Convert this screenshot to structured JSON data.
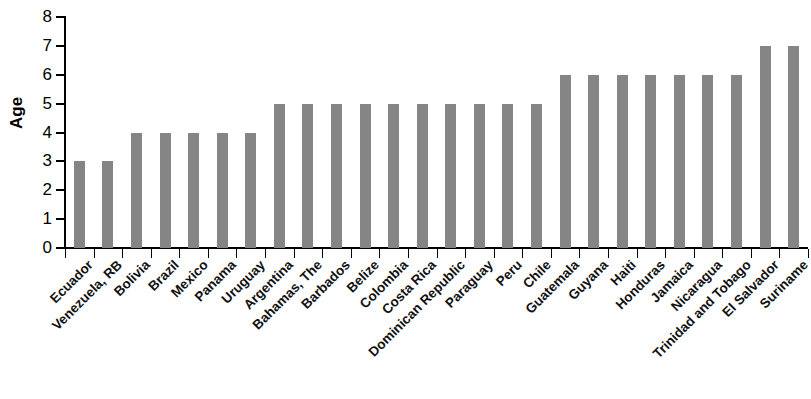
{
  "chart_data": {
    "type": "bar",
    "title": "",
    "subtitle": "",
    "xlabel": "",
    "ylabel": "Age",
    "ylim": [
      0,
      8
    ],
    "yticks": [
      0,
      1,
      2,
      3,
      4,
      5,
      6,
      7,
      8
    ],
    "grid": false,
    "legend": null,
    "bar_color": "#858585",
    "axis_color": "#000000",
    "categories": [
      "Ecuador",
      "Venezuela, RB",
      "Bolivia",
      "Brazil",
      "Mexico",
      "Panama",
      "Uruguay",
      "Argentina",
      "Bahamas, The",
      "Barbados",
      "Belize",
      "Colombia",
      "Costa Rica",
      "Dominican Republic",
      "Paraguay",
      "Peru",
      "Chile",
      "Guatemala",
      "Guyana",
      "Haiti",
      "Honduras",
      "Jamaica",
      "Nicaragua",
      "Trinidad and Tobago",
      "El Salvador",
      "Suriname"
    ],
    "values": [
      3,
      3,
      4,
      4,
      4,
      4,
      4,
      5,
      5,
      5,
      5,
      5,
      5,
      5,
      5,
      5,
      5,
      6,
      6,
      6,
      6,
      6,
      6,
      6,
      7,
      7
    ]
  }
}
